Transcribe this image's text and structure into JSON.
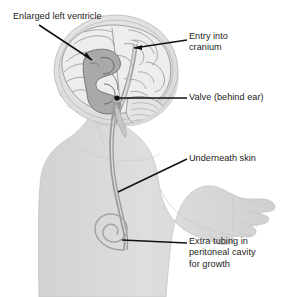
{
  "figure": {
    "background_color": "#ffffff",
    "width": 282,
    "height": 297
  },
  "palette": {
    "leader_line": "#111111",
    "label_text": "#1b1b1b",
    "body_fill": "#dcdcdc",
    "body_outline": "#c4c4c4",
    "head_fill": "#e2e2e2",
    "skull_rim": "#cfcfcf",
    "brain_fill": "#ededed",
    "brain_outline": "#8a8a8a",
    "ventricle_fill": "#a8a8a8",
    "ventricle_outline": "#6f6f6f",
    "tubing": "#9a9a9a"
  },
  "labels": [
    {
      "id": "enlarged-ventricle",
      "lines": [
        "Enlarged left ventricle"
      ],
      "text": "Enlarged left ventricle",
      "anchor": "top-left"
    },
    {
      "id": "entry-cranium",
      "lines": [
        "Entry into",
        "cranium"
      ],
      "text": "Entry into\ncranium",
      "anchor": "top-right"
    },
    {
      "id": "valve",
      "lines": [
        "Valve (behind ear)"
      ],
      "text": "Valve (behind ear)",
      "anchor": "middle-right"
    },
    {
      "id": "underneath-skin",
      "lines": [
        "Underneath skin"
      ],
      "text": "Underneath skin",
      "anchor": "middle-right"
    },
    {
      "id": "extra-tubing",
      "lines": [
        "Extra tubing in",
        "peritoneal cavity",
        "for growth"
      ],
      "text": "Extra tubing in\nperitoneal cavity\nfor growth",
      "anchor": "bottom-right"
    }
  ],
  "anatomy": {
    "parts": [
      "infant-body-silhouette",
      "head-profile",
      "skull-outline",
      "brain-cross-section",
      "enlarged-left-ventricle",
      "cerebellum",
      "shunt-catheter-in-brain",
      "shunt-valve",
      "shunt-tubing-under-skin",
      "coiled-tubing-in-abdomen",
      "arm",
      "hand"
    ]
  }
}
